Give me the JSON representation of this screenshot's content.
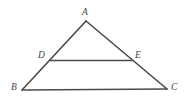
{
  "figure": {
    "background_color": "#ffffff",
    "stroke_color": "#4a4a4a",
    "label_color": "#3f3f3f",
    "width": 188,
    "height": 102
  },
  "labels": {
    "a": "A",
    "b": "B",
    "c": "C",
    "d": "D",
    "e": "E"
  },
  "geometry": {
    "points": {
      "A": {
        "x": 86,
        "y": 21
      },
      "B": {
        "x": 22,
        "y": 90
      },
      "C": {
        "x": 167,
        "y": 89
      },
      "D": {
        "x": 50,
        "y": 60
      },
      "E": {
        "x": 132,
        "y": 61
      }
    },
    "segments": [
      {
        "name": "AB",
        "from": "A",
        "to": "B"
      },
      {
        "name": "AC",
        "from": "A",
        "to": "C"
      },
      {
        "name": "BC",
        "from": "B",
        "to": "C"
      },
      {
        "name": "DE",
        "from": "D",
        "to": "E"
      }
    ]
  }
}
